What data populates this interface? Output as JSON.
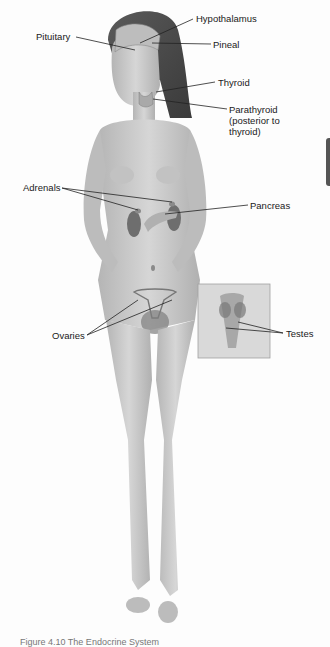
{
  "diagram": {
    "labels": {
      "hypothalamus": "Hypothalamus",
      "pituitary": "Pituitary",
      "pineal": "Pineal",
      "thyroid": "Thyroid",
      "parathyroid": "Parathyroid (posterior to thyroid)",
      "adrenals": "Adrenals",
      "pancreas": "Pancreas",
      "ovaries": "Ovaries",
      "testes": "Testes"
    },
    "caption": "Figure 4.10  The Endocrine System"
  },
  "colors": {
    "background": "#fdfdfd",
    "skin": "#c9c9c9",
    "hair": "#4a4a4a",
    "organ": "#6e6e6e",
    "leader_line": "#222222"
  }
}
